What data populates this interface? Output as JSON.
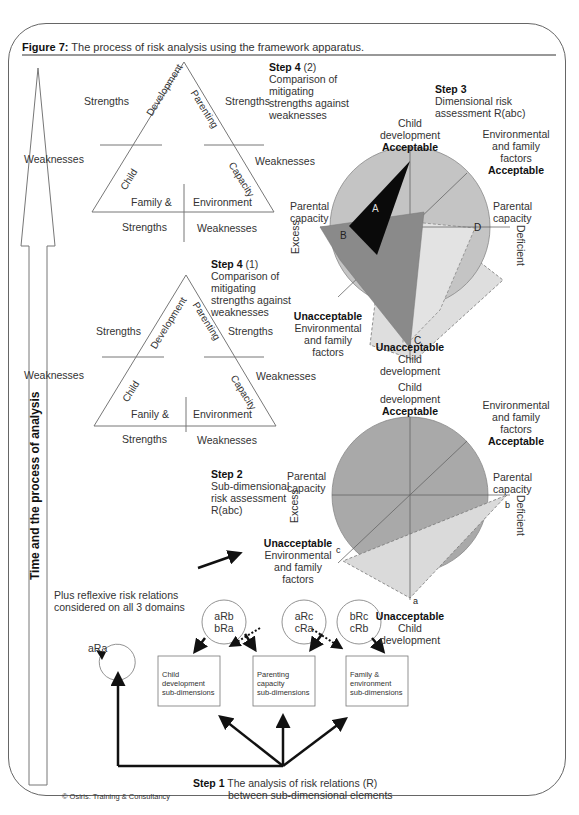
{
  "figure": {
    "title_bold": "Figure 7:",
    "title_rest": " The process of risk analysis using the framework apparatus."
  },
  "timeline_arrow": {
    "label": "Time and the process of analysis"
  },
  "triangle_top": {
    "side_left": "Development",
    "side_left_lower": "Child",
    "side_right": "Parenting",
    "side_right_lower": "Capacity",
    "base_left": "Family &",
    "base_right": "Environment",
    "left_strengths": "Strengths",
    "left_weaknesses": "Weaknesses",
    "right_strengths": "Strengths",
    "right_weaknesses": "Weaknesses",
    "bottom_strengths": "Strengths",
    "bottom_weaknesses": "Weaknesses"
  },
  "triangle_bottom": {
    "side_left": "Development",
    "side_left_lower": "Child",
    "side_right": "Parenting",
    "side_right_lower": "Capacity",
    "base_left": "Fanily &",
    "base_right": "Environment",
    "left_strengths": "Strengths",
    "left_weaknesses": "Weaknesses",
    "right_strengths": "Strengths",
    "right_weaknesses": "Weaknesses",
    "bottom_strengths": "Strengths",
    "bottom_weaknesses": "Weaknesses"
  },
  "step4_2": {
    "title": "Step 4",
    "num": " (2)",
    "lines": [
      "Comparison of",
      "mitigating",
      "strengths against",
      "weaknesses"
    ]
  },
  "step4_1": {
    "title": "Step 4",
    "num": " (1)",
    "lines": [
      "Comparison of",
      "mitigating",
      "strengths against",
      "weaknesses"
    ]
  },
  "step3": {
    "title": "Step 3",
    "lines": [
      "Dimensional risk",
      "assessment R(abc)"
    ]
  },
  "step2": {
    "title": "Step 2",
    "lines": [
      "Sub-dimensional",
      "risk assessment",
      "R(abc)"
    ]
  },
  "step1": {
    "title": "Step 1",
    "line1": " The analysis of risk relations (R)",
    "line2": "between sub-dimensional elements"
  },
  "chart_top": {
    "top_label": [
      "Child",
      "development"
    ],
    "top_status": "Acceptable",
    "tr_label": [
      "Environmental",
      "and family",
      "factors"
    ],
    "tr_status": "Acceptable",
    "left_label": [
      "Parental",
      "capacity"
    ],
    "left_axis": "Excess",
    "right_label": [
      "Parental",
      "capacity"
    ],
    "right_axis": "Deficient",
    "bl_status": "Unacceptable",
    "bl_label": [
      "Environmental",
      "and family",
      "factors"
    ],
    "bottom_status": "Unacceptable",
    "bottom_label": [
      "Child",
      "development"
    ],
    "points": [
      "A",
      "B",
      "C",
      "D"
    ]
  },
  "chart_bottom": {
    "top_label": [
      "Child",
      "development"
    ],
    "top_status": "Acceptable",
    "tr_label": [
      "Environmental",
      "and family",
      "factors"
    ],
    "tr_status": "Acceptable",
    "left_label": [
      "Parental",
      "capacity"
    ],
    "left_axis": "Excess",
    "right_label": [
      "Parental",
      "capacity"
    ],
    "right_axis": "Deficient",
    "bl_status": "Unacceptable",
    "bl_label": [
      "Environmental",
      "and family",
      "factors"
    ],
    "bottom_status": "Unacceptable",
    "bottom_label": [
      "Child",
      "development"
    ],
    "points": [
      "a",
      "b",
      "c"
    ]
  },
  "relations": {
    "reflexive_note": [
      "Plus reflexive risk relations",
      "considered on all 3 domains"
    ],
    "self": "aRa",
    "circles": [
      [
        "aRb",
        "bRa"
      ],
      [
        "aRc",
        "cRa"
      ],
      [
        "bRc",
        "cRb"
      ]
    ],
    "boxes": [
      [
        "Child",
        "development",
        "sub-dimensions"
      ],
      [
        "Parenting",
        "capacity",
        "sub-dimensions"
      ],
      [
        "Family &",
        "environment",
        "sub-dimensions"
      ]
    ]
  },
  "copyright": "© Osiris: Training & Consultancy",
  "colors": {
    "circle": "#c4c4c4",
    "dark_circle": "#a9a9a9",
    "shape_a": "#0a0a0a",
    "shape_b": "#8a8a8a",
    "shape_light": "#dcdcdc",
    "line": "#555555"
  }
}
